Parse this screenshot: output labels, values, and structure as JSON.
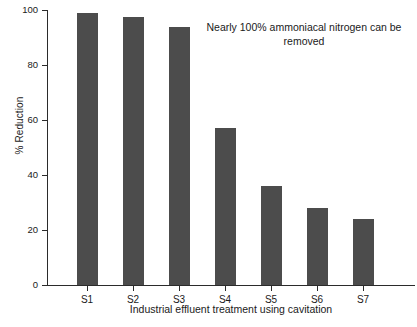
{
  "chart_data": {
    "type": "bar",
    "title": "",
    "xlabel": "Industrial effluent treatment using cavitation",
    "ylabel": "% Reduction",
    "categories": [
      "S1",
      "S2",
      "S3",
      "S4",
      "S5",
      "S6",
      "S7"
    ],
    "values": [
      99,
      97.5,
      94,
      57,
      36,
      28,
      24
    ],
    "ylim": [
      0,
      100
    ],
    "yticks": [
      0,
      20,
      40,
      60,
      80,
      100
    ],
    "ytick_labels": [
      "0",
      "20",
      "40",
      "60",
      "80",
      "100"
    ],
    "grid": false,
    "legend": false,
    "bar_color": "#4c4c4c",
    "axis_color": "#2b2b2b",
    "annotations": [
      {
        "text": "Nearly 100% ammoniacal nitrogen can be removed",
        "x_category": "S4",
        "y_value": 93
      }
    ]
  }
}
